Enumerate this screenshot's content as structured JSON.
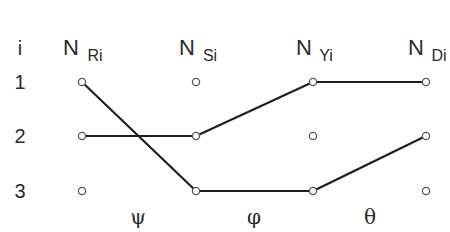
{
  "diagram": {
    "index_header": "i",
    "row_labels": [
      "1",
      "2",
      "3"
    ],
    "columns": [
      {
        "id": "R",
        "main": "N",
        "sub": "Ri",
        "x": 82
      },
      {
        "id": "S",
        "main": "N",
        "sub": "Si",
        "x": 196
      },
      {
        "id": "Y",
        "main": "N",
        "sub": "Yi",
        "x": 313
      },
      {
        "id": "D",
        "main": "N",
        "sub": "Di",
        "x": 426
      }
    ],
    "rows_y": [
      82,
      136,
      191
    ],
    "mappings": [
      {
        "symbol": "ψ",
        "from": "R",
        "to": "S",
        "x": 138
      },
      {
        "symbol": "φ",
        "from": "S",
        "to": "Y",
        "x": 254
      },
      {
        "symbol": "θ",
        "from": "Y",
        "to": "D",
        "x": 370
      }
    ],
    "edges": [
      {
        "from": [
          "R",
          1
        ],
        "to": [
          "S",
          3
        ]
      },
      {
        "from": [
          "R",
          2
        ],
        "to": [
          "S",
          2
        ]
      },
      {
        "from": [
          "S",
          2
        ],
        "to": [
          "Y",
          1
        ]
      },
      {
        "from": [
          "S",
          3
        ],
        "to": [
          "Y",
          3
        ]
      },
      {
        "from": [
          "Y",
          1
        ],
        "to": [
          "D",
          1
        ]
      },
      {
        "from": [
          "Y",
          3
        ],
        "to": [
          "D",
          2
        ]
      }
    ],
    "colors": {
      "line": "#1e1e1e",
      "node_stroke": "#555555",
      "node_fill": "#ffffff",
      "text": "#2a2a2a"
    }
  }
}
